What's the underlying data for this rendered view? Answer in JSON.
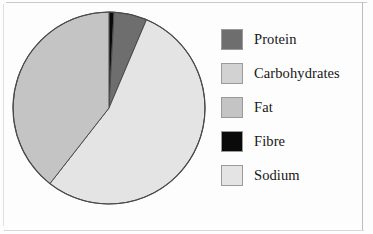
{
  "figure": {
    "background_color": "#fdfdfd",
    "frame_color": "#c9c9c9"
  },
  "chart_data": {
    "type": "pie",
    "title": "",
    "labels": [
      "Protein",
      "Carbohydrates",
      "Fat",
      "Fibre",
      "Sodium"
    ],
    "colors": [
      "#6e6e6e",
      "#d2d2d2",
      "#c4c4c4",
      "#0a0a0a",
      "#e4e4e4"
    ],
    "values": [
      5.6,
      0.0,
      39.4,
      0.8,
      54.2
    ],
    "units": "percent",
    "start_angle_deg": 0,
    "direction": "clockwise",
    "slice_order": [
      "Fibre",
      "Protein",
      "Sodium",
      "Fat"
    ],
    "slices": [
      {
        "label": "Fibre",
        "color": "#0a0a0a",
        "percent": 0.8,
        "start_deg": 0,
        "sweep_deg": 3
      },
      {
        "label": "Protein",
        "color": "#6e6e6e",
        "percent": 5.6,
        "start_deg": 3,
        "sweep_deg": 20
      },
      {
        "label": "Sodium",
        "color": "#e4e4e4",
        "percent": 54.2,
        "start_deg": 23,
        "sweep_deg": 195
      },
      {
        "label": "Fat",
        "color": "#c4c4c4",
        "percent": 39.4,
        "start_deg": 218,
        "sweep_deg": 142
      },
      {
        "label": "Carbohydrates",
        "color": "#d2d2d2",
        "percent": 0.0,
        "start_deg": 360,
        "sweep_deg": 0
      }
    ],
    "geometry": {
      "center_x": 98,
      "center_y": 99,
      "radius": 96,
      "outline_color": "#4a4a4a",
      "outline_width": 1.2
    },
    "legend": {
      "position": "right",
      "entries": [
        {
          "label": "Protein",
          "color": "#6e6e6e"
        },
        {
          "label": "Carbohydrates",
          "color": "#d2d2d2"
        },
        {
          "label": "Fat",
          "color": "#c4c4c4"
        },
        {
          "label": "Fibre",
          "color": "#0a0a0a"
        },
        {
          "label": "Sodium",
          "color": "#e4e4e4"
        }
      ]
    }
  }
}
